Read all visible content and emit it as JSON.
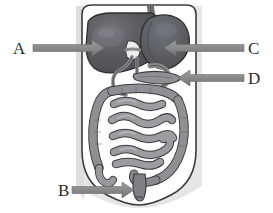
{
  "figure": {
    "background_color": "#ffffff",
    "width": 273,
    "height": 213
  },
  "labels": [
    {
      "id": "A",
      "letter": "A",
      "target_organ": "liver",
      "arrow_direction": "right",
      "arrow_from": [
        33,
        48
      ],
      "arrow_to": [
        100,
        48
      ]
    },
    {
      "id": "B",
      "letter": "B",
      "target_organ": "rectum-anus",
      "arrow_direction": "right",
      "arrow_from": [
        72,
        190
      ],
      "arrow_to": [
        133,
        190
      ]
    },
    {
      "id": "C",
      "letter": "C",
      "target_organ": "stomach",
      "arrow_direction": "left",
      "arrow_from": [
        244,
        48
      ],
      "arrow_to": [
        163,
        48
      ]
    },
    {
      "id": "D",
      "letter": "D",
      "target_organ": "pancreas",
      "arrow_direction": "left",
      "arrow_from": [
        244,
        78
      ],
      "arrow_to": [
        178,
        78
      ]
    }
  ],
  "organs": [
    {
      "name": "esophagus",
      "shade": "#6d6d70"
    },
    {
      "name": "liver",
      "shade": "#58585a"
    },
    {
      "name": "stomach",
      "shade": "#5d5d60"
    },
    {
      "name": "gallbladder",
      "shade": "#e9e9e9"
    },
    {
      "name": "bile-duct",
      "shade": "#787878"
    },
    {
      "name": "pancreas",
      "shade": "#8c8c8c"
    },
    {
      "name": "large-intestine",
      "shade": "#8f8f8f"
    },
    {
      "name": "small-intestine",
      "shade": "#9a9a9a"
    },
    {
      "name": "rectum",
      "shade": "#7d7d7d"
    },
    {
      "name": "body-outline",
      "shade": "#ffffff"
    },
    {
      "name": "body-shadow",
      "shade": "#e3e3e3"
    }
  ],
  "colors": {
    "arrow": "#8a8a8a",
    "arrow_dark": "#6f6f6f",
    "letter": "#2b2b2b",
    "outline": "#3a3a3a",
    "page_background": "#ffffff"
  }
}
